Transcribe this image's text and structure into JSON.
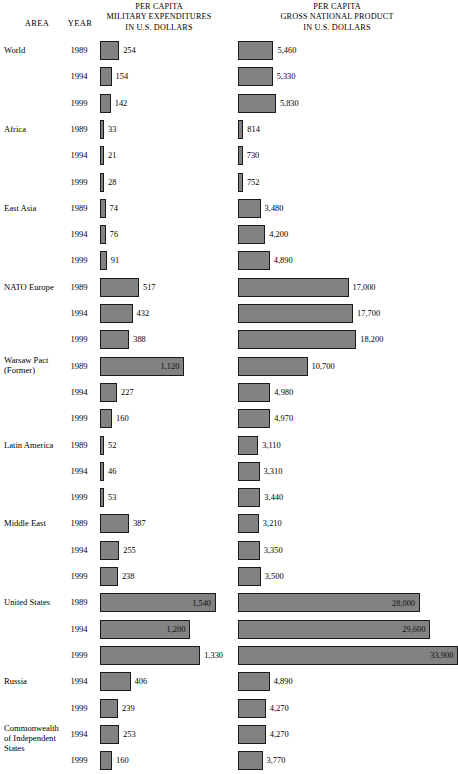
{
  "header": {
    "area_label": "AREA",
    "year_label": "YEAR",
    "military_title_lines": [
      "PER CAPITA",
      "MILITARY EXPENDITURES",
      "IN U.S. DOLLARS"
    ],
    "gnp_title_lines": [
      "PER CAPITA",
      "GROSS NATIONAL PRODUCT",
      "IN U.S. DOLLARS"
    ]
  },
  "style": {
    "bar_fill": "#828282",
    "bar_border": "#1a1a1a",
    "background": "#ffffff",
    "text": "#000000"
  },
  "chart_data": {
    "type": "bar",
    "xlabel": "",
    "ylabel": "",
    "grid": false,
    "legend": "none",
    "orientation": "horizontal",
    "series": [
      {
        "name": "PER CAPITA MILITARY EXPENDITURES IN U.S. DOLLARS",
        "units": "U.S. dollars",
        "max_value": 1540
      },
      {
        "name": "PER CAPITA GROSS NATIONAL PRODUCT IN U.S. DOLLARS",
        "units": "U.S. dollars",
        "max_value": 33900
      }
    ],
    "rows": [
      {
        "area": [
          "World"
        ],
        "year": "1989",
        "military": 254,
        "military_label": "254",
        "gnp": 5460,
        "gnp_label": "5,460"
      },
      {
        "area": [],
        "year": "1994",
        "military": 154,
        "military_label": "154",
        "gnp": 5330,
        "gnp_label": "5,330"
      },
      {
        "area": [],
        "year": "1999",
        "military": 142,
        "military_label": "142",
        "gnp": 5830,
        "gnp_label": "5,830"
      },
      {
        "area": [
          "Africa"
        ],
        "year": "1989",
        "military": 33,
        "military_label": "33",
        "gnp": 814,
        "gnp_label": "814"
      },
      {
        "area": [],
        "year": "1994",
        "military": 21,
        "military_label": "21",
        "gnp": 730,
        "gnp_label": "730"
      },
      {
        "area": [],
        "year": "1999",
        "military": 28,
        "military_label": "28",
        "gnp": 752,
        "gnp_label": "752"
      },
      {
        "area": [
          "East Asia"
        ],
        "year": "1989",
        "military": 74,
        "military_label": "74",
        "gnp": 3480,
        "gnp_label": "3,480"
      },
      {
        "area": [],
        "year": "1994",
        "military": 76,
        "military_label": "76",
        "gnp": 4200,
        "gnp_label": "4,200"
      },
      {
        "area": [],
        "year": "1999",
        "military": 91,
        "military_label": "91",
        "gnp": 4890,
        "gnp_label": "4,890"
      },
      {
        "area": [
          "NATO Europe"
        ],
        "year": "1989",
        "military": 517,
        "military_label": "517",
        "gnp": 17000,
        "gnp_label": "17,000"
      },
      {
        "area": [],
        "year": "1994",
        "military": 432,
        "military_label": "432",
        "gnp": 17700,
        "gnp_label": "17,700"
      },
      {
        "area": [],
        "year": "1999",
        "military": 388,
        "military_label": "388",
        "gnp": 18200,
        "gnp_label": "18,200"
      },
      {
        "area": [
          "Warsaw Pact",
          "(Former)"
        ],
        "year": "1989",
        "military": 1120,
        "military_label": "1,120",
        "military_inside": true,
        "gnp": 10700,
        "gnp_label": "10,700"
      },
      {
        "area": [],
        "year": "1994",
        "military": 227,
        "military_label": "227",
        "gnp": 4980,
        "gnp_label": "4,980"
      },
      {
        "area": [],
        "year": "1999",
        "military": 160,
        "military_label": "160",
        "gnp": 4970,
        "gnp_label": "4,970"
      },
      {
        "area": [
          "Latin America"
        ],
        "year": "1989",
        "military": 52,
        "military_label": "52",
        "gnp": 3110,
        "gnp_label": "3,110"
      },
      {
        "area": [],
        "year": "1994",
        "military": 46,
        "military_label": "46",
        "gnp": 3310,
        "gnp_label": "3,310"
      },
      {
        "area": [],
        "year": "1999",
        "military": 53,
        "military_label": "53",
        "gnp": 3440,
        "gnp_label": "3,440"
      },
      {
        "area": [
          "Middle East"
        ],
        "year": "1989",
        "military": 387,
        "military_label": "387",
        "gnp": 3210,
        "gnp_label": "3,210"
      },
      {
        "area": [],
        "year": "1994",
        "military": 255,
        "military_label": "255",
        "gnp": 3350,
        "gnp_label": "3,350"
      },
      {
        "area": [],
        "year": "1999",
        "military": 238,
        "military_label": "238",
        "gnp": 3500,
        "gnp_label": "3,500"
      },
      {
        "area": [
          "United States"
        ],
        "year": "1989",
        "military": 1540,
        "military_label": "1,540",
        "military_inside": true,
        "gnp": 28000,
        "gnp_label": "28,000",
        "gnp_inside": true
      },
      {
        "area": [],
        "year": "1994",
        "military": 1200,
        "military_label": "1,200",
        "military_inside": true,
        "gnp": 29600,
        "gnp_label": "29,600",
        "gnp_inside": true
      },
      {
        "area": [],
        "year": "1999",
        "military": 1330,
        "military_label": "1,330",
        "gnp": 33900,
        "gnp_label": "33,900",
        "gnp_inside": true
      },
      {
        "area": [
          "Russia"
        ],
        "year": "1994",
        "military": 406,
        "military_label": "406",
        "gnp": 4890,
        "gnp_label": "4,890"
      },
      {
        "area": [],
        "year": "1999",
        "military": 239,
        "military_label": "239",
        "gnp": 4270,
        "gnp_label": "4,270"
      },
      {
        "area": [
          "Commonwealth",
          "of Independent",
          "States"
        ],
        "year": "1994",
        "military": 253,
        "military_label": "253",
        "gnp": 4270,
        "gnp_label": "4,270"
      },
      {
        "area": [],
        "year": "1999",
        "military": 160,
        "military_label": "160",
        "gnp": 3770,
        "gnp_label": "3,770"
      }
    ]
  }
}
